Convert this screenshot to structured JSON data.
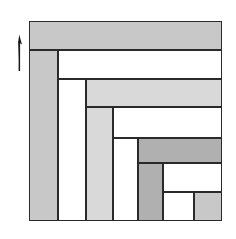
{
  "figure": {
    "canvas": {
      "width": 236,
      "height": 239,
      "background": "#ffffff"
    },
    "frame": {
      "x": 29,
      "y": 21,
      "width": 193,
      "height": 200
    },
    "stroke": {
      "color": "#2a2a2a",
      "width": 1.6
    }
  },
  "palette": {
    "white": "#ffffff",
    "gray_medium": "#c8c8c8",
    "gray_light": "#d9d9d9",
    "gray_dark": "#b0b0b0",
    "outline": "#2a2a2a",
    "arrow": "#1a1a1a"
  },
  "marker": {
    "name": "up-arrow",
    "label": "",
    "direction": "up",
    "x": 14,
    "y": 33,
    "width": 14,
    "height": 38,
    "color": "#1a1a1a"
  },
  "pieces": [
    {
      "id": "band-top",
      "order": 1,
      "orientation": "horizontal",
      "fill": "#c8c8c8",
      "x": 0,
      "y": 0,
      "width": 193,
      "height": 29
    },
    {
      "id": "band-left",
      "order": 2,
      "orientation": "vertical",
      "fill": "#c8c8c8",
      "x": 0,
      "y": 29,
      "width": 29,
      "height": 171
    },
    {
      "id": "band-upper-white",
      "order": 3,
      "orientation": "horizontal",
      "fill": "#ffffff",
      "x": 29,
      "y": 29,
      "width": 164,
      "height": 29
    },
    {
      "id": "column-white-1",
      "order": 4,
      "orientation": "vertical",
      "fill": "#ffffff",
      "x": 29,
      "y": 58,
      "width": 28,
      "height": 142
    },
    {
      "id": "band-light-gray",
      "order": 5,
      "orientation": "horizontal",
      "fill": "#d9d9d9",
      "x": 57,
      "y": 58,
      "width": 136,
      "height": 28
    },
    {
      "id": "column-light-gray",
      "order": 6,
      "orientation": "vertical",
      "fill": "#d9d9d9",
      "x": 57,
      "y": 86,
      "width": 27,
      "height": 114
    },
    {
      "id": "band-mid-white",
      "order": 7,
      "orientation": "horizontal",
      "fill": "#ffffff",
      "x": 84,
      "y": 86,
      "width": 109,
      "height": 31
    },
    {
      "id": "column-white-2",
      "order": 8,
      "orientation": "vertical",
      "fill": "#ffffff",
      "x": 84,
      "y": 117,
      "width": 25,
      "height": 83
    },
    {
      "id": "band-dark-gray",
      "order": 9,
      "orientation": "horizontal",
      "fill": "#b0b0b0",
      "x": 109,
      "y": 117,
      "width": 84,
      "height": 25
    },
    {
      "id": "column-dark-gray",
      "order": 10,
      "orientation": "vertical",
      "fill": "#b0b0b0",
      "x": 109,
      "y": 142,
      "width": 25,
      "height": 58
    },
    {
      "id": "band-lower-white",
      "order": 11,
      "orientation": "horizontal",
      "fill": "#ffffff",
      "x": 134,
      "y": 142,
      "width": 59,
      "height": 29
    },
    {
      "id": "square-white-small",
      "order": 12,
      "orientation": "square",
      "fill": "#ffffff",
      "x": 134,
      "y": 171,
      "width": 31,
      "height": 29
    },
    {
      "id": "square-gray-corner",
      "order": 13,
      "orientation": "square",
      "fill": "#c8c8c8",
      "x": 165,
      "y": 171,
      "width": 28,
      "height": 29
    }
  ]
}
